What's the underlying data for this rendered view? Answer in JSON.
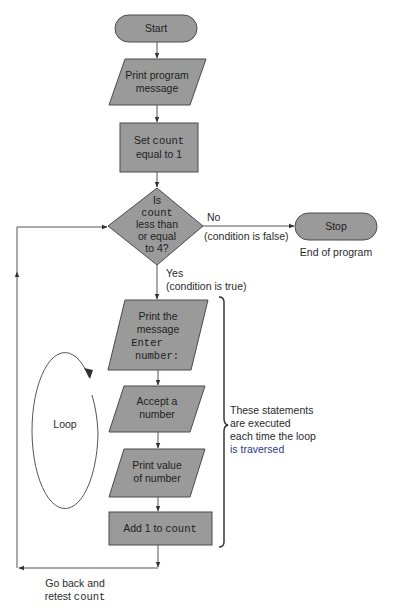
{
  "diagram": {
    "type": "flowchart",
    "colors": {
      "shape_fill": "#9a9a9a",
      "shape_stroke": "#4a4a4a",
      "line": "#555555",
      "text": "#1e1e1e",
      "highlight_text": "#2c3a88"
    },
    "nodes": {
      "start": {
        "shape": "terminator",
        "label": "Start"
      },
      "print_program_message": {
        "shape": "io-parallelogram",
        "line1": "Print program",
        "line2": "message"
      },
      "set_count": {
        "shape": "process-rectangle",
        "line1_prefix": "Set ",
        "line1_code": "count",
        "line2": "equal to 1"
      },
      "decision": {
        "shape": "decision-diamond",
        "line1": "Is",
        "line2_code": "count",
        "line3": "less than",
        "line4": "or equal",
        "line5": "to 4?"
      },
      "stop": {
        "shape": "terminator",
        "label": "Stop",
        "caption": "End of program"
      },
      "print_enter_number": {
        "shape": "io-parallelogram",
        "line1": "Print the",
        "line2": "message",
        "line3_code": "Enter",
        "line4_code": "number:"
      },
      "accept_number": {
        "shape": "io-parallelogram",
        "line1": "Accept a",
        "line2": "number"
      },
      "print_value": {
        "shape": "io-parallelogram",
        "line1": "Print value",
        "line2": "of number"
      },
      "add_one": {
        "shape": "process-rectangle",
        "label_prefix": "Add 1 to ",
        "label_code": "count"
      }
    },
    "edges": {
      "no_branch": {
        "label": "No",
        "sublabel": "(condition is false)"
      },
      "yes_branch": {
        "label": "Yes",
        "sublabel": "(condition is true)"
      },
      "return": {
        "line1": "Go back and",
        "line2_prefix": "retest ",
        "line2_code": "count"
      }
    },
    "annotations": {
      "loop_label": "Loop",
      "bracket_note": {
        "line1": "These statements",
        "line2": "are executed",
        "line3": "each time the loop",
        "line4": "is traversed"
      }
    }
  }
}
